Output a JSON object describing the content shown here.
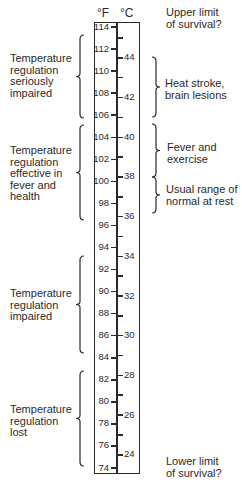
{
  "header": {
    "fahrenheit_label": "°F",
    "celsius_label": "°C"
  },
  "scale": {
    "fahrenheit": [
      {
        "value": 114,
        "label": "114"
      },
      {
        "value": 112,
        "label": "112"
      },
      {
        "value": 110,
        "label": "110"
      },
      {
        "value": 108,
        "label": "108"
      },
      {
        "value": 106,
        "label": "106"
      },
      {
        "value": 104,
        "label": "104"
      },
      {
        "value": 102,
        "label": "102"
      },
      {
        "value": 100,
        "label": "100"
      },
      {
        "value": 98,
        "label": "98"
      },
      {
        "value": 96,
        "label": "96"
      },
      {
        "value": 94,
        "label": "94"
      },
      {
        "value": 92,
        "label": "92"
      },
      {
        "value": 90,
        "label": "90"
      },
      {
        "value": 88,
        "label": "88"
      },
      {
        "value": 86,
        "label": "86"
      },
      {
        "value": 84,
        "label": "84"
      },
      {
        "value": 82,
        "label": "82"
      },
      {
        "value": 80,
        "label": "80"
      },
      {
        "value": 78,
        "label": "78"
      },
      {
        "value": 76,
        "label": "76"
      },
      {
        "value": 74,
        "label": "74"
      }
    ],
    "celsius": [
      {
        "value": 45,
        "label": ""
      },
      {
        "value": 44,
        "label": "44"
      },
      {
        "value": 43,
        "label": ""
      },
      {
        "value": 42,
        "label": "42"
      },
      {
        "value": 41,
        "label": ""
      },
      {
        "value": 40,
        "label": "40"
      },
      {
        "value": 39,
        "label": ""
      },
      {
        "value": 38,
        "label": "38"
      },
      {
        "value": 37,
        "label": ""
      },
      {
        "value": 36,
        "label": "36"
      },
      {
        "value": 35,
        "label": ""
      },
      {
        "value": 34,
        "label": "34"
      },
      {
        "value": 33,
        "label": ""
      },
      {
        "value": 32,
        "label": "32"
      },
      {
        "value": 31,
        "label": ""
      },
      {
        "value": 30,
        "label": "30"
      },
      {
        "value": 29,
        "label": ""
      },
      {
        "value": 28,
        "label": "28"
      },
      {
        "value": 27,
        "label": ""
      },
      {
        "value": 26,
        "label": "26"
      },
      {
        "value": 25,
        "label": ""
      },
      {
        "value": 24,
        "label": "24"
      }
    ]
  },
  "left_notes": [
    {
      "lines": [
        "Temperature",
        "regulation",
        "seriously",
        "impaired"
      ],
      "brace_top": 35,
      "brace_bottom": 118
    },
    {
      "lines": [
        "Temperature",
        "regulation",
        "effective in",
        "fever and",
        "health"
      ],
      "brace_top": 125,
      "brace_bottom": 220
    },
    {
      "lines": [
        "Temperature",
        "regulation",
        "impaired"
      ],
      "brace_top": 256,
      "brace_bottom": 353
    },
    {
      "lines": [
        "Temperature",
        "regulation",
        "lost"
      ],
      "brace_top": 371,
      "brace_bottom": 466
    }
  ],
  "right_notes": [
    {
      "lines": [
        "Upper limit",
        "of survival?"
      ],
      "brace": false
    },
    {
      "lines": [
        "Heat stroke,",
        "brain lesions"
      ],
      "brace": true,
      "brace_top": 57,
      "brace_bottom": 117
    },
    {
      "lines": [
        "Fever and",
        "exercise"
      ],
      "brace": true,
      "brace_top": 124,
      "brace_bottom": 177
    },
    {
      "lines": [
        "Usual range of",
        "normal at rest"
      ],
      "brace": true,
      "brace_top": 177,
      "brace_bottom": 213
    },
    {
      "lines": [
        "Lower limit",
        "of survival?"
      ],
      "brace": false
    }
  ]
}
